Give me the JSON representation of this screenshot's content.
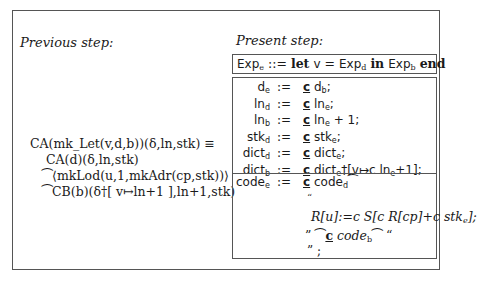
{
  "labels": {
    "previous": "Previous step:",
    "present": "Present step:"
  },
  "previous": {
    "lines": [
      "CA(mk_Let(v,d,b))(δ,ln,stk) ≡",
      "CA(d)(δ,ln,stk)",
      "⁀⟨mkLod(u,1,mkAdr(cp,stk))⟩",
      "⁀CB(b)(δ†[ v↦ln+1 ],ln+1,stk)"
    ]
  },
  "present": {
    "header": {
      "lhs": "Exp",
      "lhs_sub": "e",
      "op": "::=",
      "kw_let": "let",
      "var": "v",
      "eq": "=",
      "d": "Exp",
      "d_sub": "d",
      "kw_in": "in",
      "b": "Exp",
      "b_sub": "b",
      "kw_end": "end"
    },
    "defs": [
      {
        "lhs": "d",
        "sub": "e",
        "op": ":=",
        "c": "c",
        "rhs": "d",
        "rsub": "b",
        "tail": ";"
      },
      {
        "lhs": "ln",
        "sub": "d",
        "op": ":=",
        "c": "c",
        "rhs": "ln",
        "rsub": "e",
        "tail": ";"
      },
      {
        "lhs": "ln",
        "sub": "b",
        "op": ":=",
        "c": "c",
        "rhs": "ln",
        "rsub": "e",
        "tail": " + 1;"
      },
      {
        "lhs": "stk",
        "sub": "d",
        "op": ":=",
        "c": "c",
        "rhs": "stk",
        "rsub": "e",
        "tail": ";"
      },
      {
        "lhs": "dict",
        "sub": "d",
        "op": ":=",
        "c": "c",
        "rhs": "dict",
        "rsub": "e",
        "tail": ";"
      },
      {
        "lhs": "dict",
        "sub": "b",
        "op": ":=",
        "c": "c",
        "rhs": "dict",
        "rsub": "e",
        "tail": "†[v↦c ln",
        "tail_sub": "e",
        "tail2": "+1];"
      }
    ],
    "code": {
      "lhs": "code",
      "lhs_sub": "e",
      "op": ":=",
      "c": "c",
      "rhs": "code",
      "rhs_sub": "d",
      "concat": "⁀",
      "open_quote": "“",
      "assign": "R[u]:=c S[c R[cp]+c stk",
      "assign_sub": "e",
      "assign_end": "];",
      "close_quote": "”",
      "code_b": "code",
      "code_b_sub": "b",
      "final": "” ;"
    }
  }
}
